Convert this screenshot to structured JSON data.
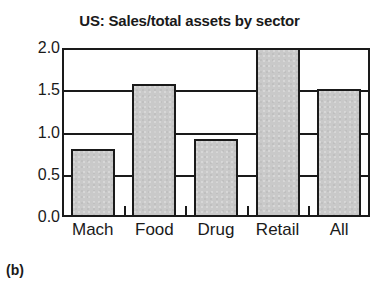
{
  "panel": {
    "caption": "(b)"
  },
  "chart_data": {
    "type": "bar",
    "title": "US: Sales/total assets by sector",
    "subtitle": "",
    "xlabel": "",
    "ylabel": "",
    "categories": [
      "Mach",
      "Food",
      "Drug",
      "Retail",
      "All"
    ],
    "values": [
      0.81,
      1.57,
      0.92,
      2.0,
      1.51
    ],
    "series": [
      {
        "name": "Sales/total assets",
        "values": [
          0.81,
          1.57,
          0.92,
          2.0,
          1.51
        ]
      }
    ],
    "ylim": [
      0.0,
      2.0
    ],
    "ytick_labels": [
      "0.0",
      "0.5",
      "1.0",
      "1.5",
      "2.0"
    ],
    "ytick_values": [
      0.0,
      0.5,
      1.0,
      1.5,
      2.0
    ],
    "grid": true,
    "grid_axis": "y",
    "legend": false,
    "legend_position": "none",
    "annotations": [],
    "colors": {
      "bar_fill": "#c9c9c9",
      "bar_edge": "#1a1a1a",
      "axis": "#1a1a1a",
      "grid": "#1a1a1a",
      "background": "#ffffff",
      "text": "#1a1a1a"
    }
  }
}
